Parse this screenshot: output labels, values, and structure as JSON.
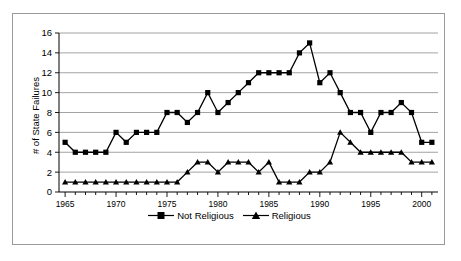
{
  "chart_data": {
    "type": "line",
    "title": "",
    "xlabel": "",
    "ylabel": "# of State Failures",
    "x": [
      1965,
      1966,
      1967,
      1968,
      1969,
      1970,
      1971,
      1972,
      1973,
      1974,
      1975,
      1976,
      1977,
      1978,
      1979,
      1980,
      1981,
      1982,
      1983,
      1984,
      1985,
      1986,
      1987,
      1988,
      1989,
      1990,
      1991,
      1992,
      1993,
      1994,
      1995,
      1996,
      1997,
      1998,
      1999,
      2000,
      2001
    ],
    "xlim": [
      1964.4,
      2001.6
    ],
    "ylim": [
      0,
      16
    ],
    "yticks": [
      0,
      2,
      4,
      6,
      8,
      10,
      12,
      14,
      16
    ],
    "xticks_labeled": [
      1965,
      1970,
      1975,
      1980,
      1985,
      1990,
      1995,
      2000
    ],
    "grid": "horizontal",
    "legend_position": "bottom",
    "series": [
      {
        "name": "Not Religious",
        "marker": "square",
        "color": "#000000",
        "values": [
          5,
          4,
          4,
          4,
          4,
          6,
          5,
          6,
          6,
          6,
          8,
          8,
          7,
          8,
          10,
          8,
          9,
          10,
          11,
          12,
          12,
          12,
          12,
          14,
          15,
          11,
          12,
          10,
          8,
          8,
          6,
          8,
          8,
          9,
          8,
          5,
          5
        ]
      },
      {
        "name": "Religious",
        "marker": "triangle",
        "color": "#000000",
        "values": [
          1,
          1,
          1,
          1,
          1,
          1,
          1,
          1,
          1,
          1,
          1,
          1,
          2,
          3,
          3,
          2,
          3,
          3,
          3,
          2,
          3,
          1,
          1,
          1,
          2,
          2,
          3,
          6,
          5,
          4,
          4,
          4,
          4,
          4,
          3,
          3,
          3
        ]
      }
    ]
  },
  "legend": {
    "entries": [
      {
        "label": "Not Religious"
      },
      {
        "label": "Religious"
      }
    ]
  },
  "axis": {
    "y_title": "# of State Failures"
  }
}
